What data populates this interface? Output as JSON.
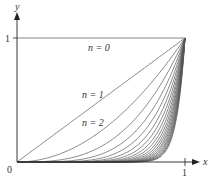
{
  "chart_data": {
    "type": "line",
    "title": "",
    "xlabel": "x",
    "ylabel": "y",
    "xlim": [
      0,
      1
    ],
    "ylim": [
      0,
      1
    ],
    "grid": false,
    "legend": "none",
    "function": "y = x^n",
    "x_ticks": [
      "0",
      "1"
    ],
    "y_ticks": [
      "1"
    ],
    "origin_label": "0",
    "annotations": [
      {
        "text": "n = 0",
        "n": 0
      },
      {
        "text": "n = 1",
        "n": 1
      },
      {
        "text": "n = 2",
        "n": 2
      }
    ],
    "series": [
      {
        "name": "n = 0",
        "n": 0
      },
      {
        "name": "n = 1",
        "n": 1
      },
      {
        "name": "n = 2",
        "n": 2
      },
      {
        "name": "n = 3",
        "n": 3
      },
      {
        "name": "n = 4",
        "n": 4
      },
      {
        "name": "n = 5",
        "n": 5
      },
      {
        "name": "n = 6",
        "n": 6
      },
      {
        "name": "n = 7",
        "n": 7
      },
      {
        "name": "n = 8",
        "n": 8
      },
      {
        "name": "n = 9",
        "n": 9
      },
      {
        "name": "n = 10",
        "n": 10
      },
      {
        "name": "n = 11",
        "n": 11
      },
      {
        "name": "n = 12",
        "n": 12
      },
      {
        "name": "n = 13",
        "n": 13
      },
      {
        "name": "n = 14",
        "n": 14
      },
      {
        "name": "n = 15",
        "n": 15
      },
      {
        "name": "n = 16",
        "n": 16
      },
      {
        "name": "n = 17",
        "n": 17
      },
      {
        "name": "n = 18",
        "n": 18
      },
      {
        "name": "n = 19",
        "n": 19
      },
      {
        "name": "n = 20",
        "n": 20
      }
    ]
  },
  "labels": {
    "x_axis": "x",
    "y_axis": "y",
    "origin": "0",
    "x_one": "1",
    "y_one": "1",
    "n0": "n = 0",
    "n1": "n = 1",
    "n2": "n = 2"
  },
  "colors": {
    "axis": "#222222",
    "curve": "#555555",
    "text": "#333333"
  }
}
